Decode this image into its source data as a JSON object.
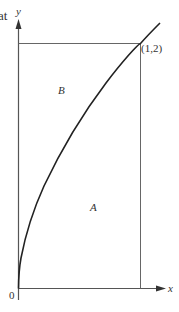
{
  "diagram": {
    "type": "region-under-curve",
    "curve": "y = 2*sqrt(x)",
    "cropped_text_top_left": "at",
    "axes": {
      "x_label": "x",
      "y_label": "y",
      "origin_label": "0"
    },
    "point": {
      "label": "(1,2)",
      "x": 1,
      "y": 2
    },
    "regions": [
      {
        "label": "B",
        "description": "region between curve and y-axis, below y=2"
      },
      {
        "label": "A",
        "description": "region between curve and x-axis, left of x=1"
      }
    ],
    "colors": {
      "axis": "#555555",
      "curve": "#222222",
      "guide_lines": "#666666",
      "text": "#333333"
    }
  }
}
